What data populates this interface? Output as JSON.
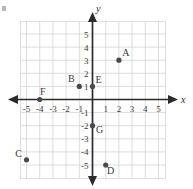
{
  "chart_data": {
    "type": "scatter",
    "title": "",
    "xlabel": "x",
    "ylabel": "y",
    "xlim": [
      -6,
      6
    ],
    "ylim": [
      -6,
      6
    ],
    "grid": true,
    "legend": "none",
    "xticks": [
      "-5",
      "-4",
      "-3",
      "-2",
      "-1",
      "1",
      "2",
      "3",
      "4",
      "5"
    ],
    "xtick_values": [
      -5,
      -4,
      -3,
      -2,
      -1,
      1,
      2,
      3,
      4,
      5
    ],
    "yticks": [
      "5",
      "4",
      "3",
      "2",
      "1",
      "-1",
      "-2",
      "-3",
      "-4",
      "-5"
    ],
    "ytick_values": [
      5,
      4,
      3,
      2,
      1,
      -1,
      -2,
      -3,
      -4,
      -5
    ],
    "points": [
      {
        "label": "A",
        "x": 2,
        "y": 3
      },
      {
        "label": "B",
        "x": -1,
        "y": 1
      },
      {
        "label": "C",
        "x": -5,
        "y": -4.6
      },
      {
        "label": "D",
        "x": 1,
        "y": -5
      },
      {
        "label": "E",
        "x": 0,
        "y": 1
      },
      {
        "label": "F",
        "x": -4,
        "y": 0
      },
      {
        "label": "G",
        "x": 0,
        "y": -2
      }
    ],
    "colors": {
      "point": "#4a4a4a",
      "axis": "#2b2b2b",
      "grid": "#cfcfcf",
      "text": "#3a3a3a"
    }
  },
  "axes": {
    "x_axis_label": "x",
    "y_axis_label": "y"
  }
}
